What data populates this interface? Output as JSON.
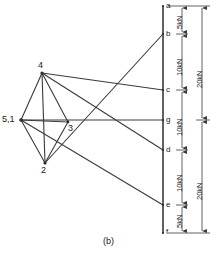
{
  "figure": {
    "caption": "(b)",
    "type": "maxwell-force-diagram",
    "line_color": "#3a3a3a",
    "text_color": "#1a1a1a",
    "background": "#ffffff"
  },
  "load_line": {
    "name": "vertical-load-line",
    "x": 163,
    "y_top": 6,
    "y_bottom": 233,
    "points": [
      {
        "label": "a",
        "y": 6
      },
      {
        "label": "b",
        "y": 34
      },
      {
        "label": "c",
        "y": 90
      },
      {
        "label": "g",
        "y": 120
      },
      {
        "label": "d",
        "y": 150
      },
      {
        "label": "e",
        "y": 205
      },
      {
        "label": "f",
        "y": 233
      }
    ]
  },
  "polygon_nodes": [
    {
      "label": "5,1",
      "x": 21,
      "y": 120,
      "label_x": 2,
      "label_y": 116
    },
    {
      "label": "4",
      "x": 42,
      "y": 73,
      "label_x": 38,
      "label_y": 62
    },
    {
      "label": "3",
      "x": 68,
      "y": 122,
      "label_x": 68,
      "label_y": 124
    },
    {
      "label": "2",
      "x": 45,
      "y": 163,
      "label_x": 41,
      "label_y": 166
    }
  ],
  "dimensions": {
    "inner_chain": {
      "x": 182,
      "segments": [
        {
          "label": "5kN",
          "from": "a",
          "to": "b",
          "y1": 6,
          "y2": 34
        },
        {
          "label": "10kN",
          "from": "b",
          "to": "c",
          "y1": 34,
          "y2": 90
        },
        {
          "label": "10kN",
          "from": "c",
          "to": "d",
          "y1": 90,
          "y2": 150
        },
        {
          "label": "10kN",
          "from": "d",
          "to": "e",
          "y1": 150,
          "y2": 205
        },
        {
          "label": "5kN",
          "from": "e",
          "to": "f",
          "y1": 205,
          "y2": 233
        }
      ]
    },
    "outer_chain": {
      "x": 202,
      "segments": [
        {
          "label": "20kN",
          "from": "a",
          "to": "g",
          "y1": 6,
          "y2": 120
        },
        {
          "label": "20kN",
          "from": "g",
          "to": "f",
          "y1": 120,
          "y2": 233
        }
      ]
    }
  },
  "ray_lines": [
    {
      "from": "2",
      "to": "b"
    },
    {
      "from": "4",
      "to": "c"
    },
    {
      "from": "4",
      "to": "d"
    },
    {
      "from": "5,1",
      "to": "e"
    },
    {
      "from": "5,1",
      "to": "g"
    }
  ],
  "polygon_edges": [
    {
      "from": "5,1",
      "to": "4"
    },
    {
      "from": "5,1",
      "to": "3"
    },
    {
      "from": "5,1",
      "to": "2"
    },
    {
      "from": "4",
      "to": "3"
    },
    {
      "from": "4",
      "to": "2"
    },
    {
      "from": "3",
      "to": "2"
    }
  ]
}
